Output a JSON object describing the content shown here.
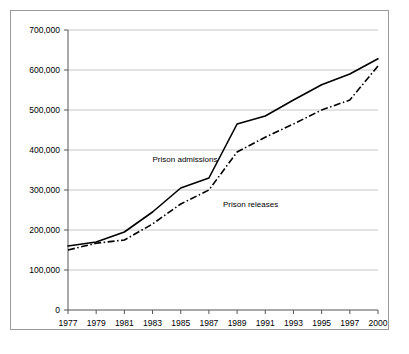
{
  "chart_data": {
    "type": "line",
    "title": "",
    "subtitle": "",
    "xlabel": "",
    "ylabel": "",
    "grid": true,
    "legend_position": "inline-annotation",
    "x": [
      "1977",
      "1979",
      "1981",
      "1983",
      "1985",
      "1987",
      "1989",
      "1991",
      "1993",
      "1995",
      "1997",
      "2000"
    ],
    "xtick_labels": [
      "1977",
      "1979",
      "1981",
      "1983",
      "1985",
      "1987",
      "1989",
      "1991",
      "1993",
      "1995",
      "1997",
      "2000"
    ],
    "ytick_labels": [
      "0",
      "100,000",
      "200,000",
      "300,000",
      "400,000",
      "500,000",
      "600,000",
      "700,000"
    ],
    "ytick_values": [
      0,
      100000,
      200000,
      300000,
      400000,
      500000,
      600000,
      700000
    ],
    "ylim": [
      0,
      700000
    ],
    "series": [
      {
        "name": "Prison admissions",
        "style": "solid",
        "color": "#000000",
        "values": [
          160000,
          170000,
          195000,
          245000,
          305000,
          330000,
          465000,
          485000,
          525000,
          563000,
          590000,
          628000
        ]
      },
      {
        "name": "Prison releases",
        "style": "dash-dot",
        "color": "#000000",
        "values": [
          150000,
          167000,
          175000,
          215000,
          265000,
          300000,
          395000,
          432000,
          465000,
          500000,
          525000,
          610000
        ]
      }
    ],
    "annotations": [
      {
        "text": "Prison admissions",
        "x_year": "1983",
        "y_value": 370000
      },
      {
        "text": "Prison releases",
        "x_year": "1988",
        "y_value": 258000
      }
    ]
  },
  "figure": {
    "border_color": "#9a9a9a",
    "background": "#ffffff",
    "gridline_color": "#b9b9b9",
    "axis_color": "#555555"
  }
}
